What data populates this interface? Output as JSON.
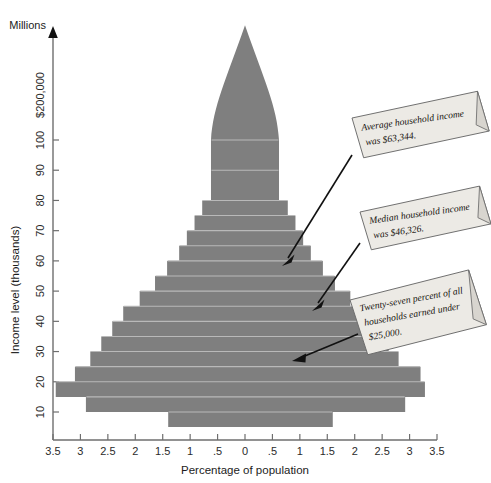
{
  "chart_data": {
    "type": "bar",
    "orientation": "horizontal-pyramid",
    "title": "",
    "xlabel": "Percentage of population",
    "ylabel": "Income level (thousands)",
    "unit_note": "Millions",
    "top_axis_label": "$200,000",
    "xlim": [
      -3.5,
      3.5
    ],
    "xticks": [
      "3.5",
      "3",
      "2.5",
      "2",
      "1.5",
      "1",
      ".5",
      "0",
      ".5",
      "1",
      "1.5",
      "2",
      "2.5",
      "3",
      "3.5"
    ],
    "xtick_values": [
      -3.5,
      -3,
      -2.5,
      -2,
      -1.5,
      -1,
      -0.5,
      0,
      0.5,
      1,
      1.5,
      2,
      2.5,
      3,
      3.5
    ],
    "yticks": [
      "100",
      "90",
      "80",
      "70",
      "60",
      "50",
      "40",
      "30",
      "20",
      "10"
    ],
    "ytick_values": [
      100,
      90,
      80,
      70,
      60,
      50,
      40,
      30,
      20,
      10
    ],
    "grid": false,
    "legend": "none",
    "series": [
      {
        "name": "Percentage of population by income level",
        "bars": [
          {
            "income_label": "under 10",
            "y_low": 5,
            "y_high": 10,
            "half_width": 1.55,
            "left": -1.4,
            "right": 1.6
          },
          {
            "income_label": "10-15",
            "y_low": 10,
            "y_high": 15,
            "half_width": 2.95,
            "left": -2.9,
            "right": 2.92
          },
          {
            "income_label": "15-20",
            "y_low": 15,
            "y_high": 20,
            "half_width": 3.45,
            "left": -3.45,
            "right": 3.28
          },
          {
            "income_label": "20-25",
            "y_low": 20,
            "y_high": 25,
            "half_width": 3.1,
            "left": -3.1,
            "right": 3.2
          },
          {
            "income_label": "25-30",
            "y_low": 25,
            "y_high": 30,
            "half_width": 2.82,
            "left": -2.82,
            "right": 2.8
          },
          {
            "income_label": "30-35",
            "y_low": 30,
            "y_high": 35,
            "half_width": 2.62,
            "left": -2.62,
            "right": 2.62
          },
          {
            "income_label": "35-40",
            "y_low": 35,
            "y_high": 40,
            "half_width": 2.42,
            "left": -2.42,
            "right": 2.42
          },
          {
            "income_label": "40-45",
            "y_low": 40,
            "y_high": 45,
            "half_width": 2.22,
            "left": -2.22,
            "right": 2.22
          },
          {
            "income_label": "45-50",
            "y_low": 45,
            "y_high": 50,
            "half_width": 1.92,
            "left": -1.92,
            "right": 1.92
          },
          {
            "income_label": "50-55",
            "y_low": 50,
            "y_high": 55,
            "half_width": 1.64,
            "left": -1.64,
            "right": 1.64
          },
          {
            "income_label": "55-60",
            "y_low": 55,
            "y_high": 60,
            "half_width": 1.42,
            "left": -1.42,
            "right": 1.42
          },
          {
            "income_label": "60-65",
            "y_low": 60,
            "y_high": 65,
            "half_width": 1.2,
            "left": -1.2,
            "right": 1.2
          },
          {
            "income_label": "65-70",
            "y_low": 65,
            "y_high": 70,
            "half_width": 1.06,
            "left": -1.06,
            "right": 1.06
          },
          {
            "income_label": "70-75",
            "y_low": 70,
            "y_high": 75,
            "half_width": 0.92,
            "left": -0.92,
            "right": 0.92
          },
          {
            "income_label": "75-80",
            "y_low": 75,
            "y_high": 80,
            "half_width": 0.78,
            "left": -0.78,
            "right": 0.78
          },
          {
            "income_label": "80-90",
            "y_low": 80,
            "y_high": 90,
            "half_width": 0.62,
            "left": -0.62,
            "right": 0.62
          },
          {
            "income_label": "90-100",
            "y_low": 90,
            "y_high": 100,
            "half_width": 0.62,
            "left": -0.62,
            "right": 0.62
          },
          {
            "income_label": "100-200 (spire)",
            "y_low": 100,
            "y_high": 200,
            "half_width": 0.22,
            "left": -0.22,
            "right": 0.22
          }
        ]
      }
    ]
  },
  "annotations": [
    {
      "id": "average-income",
      "line1": "Average household income",
      "line2": "was $63,344.",
      "target_income": 60,
      "target_percent": 0.6
    },
    {
      "id": "median-income",
      "line1": "Median household income",
      "line2": "was $46,326.",
      "line3": "",
      "target_income": 45,
      "target_percent": 1.0
    },
    {
      "id": "under-25k",
      "line1": "Twenty-seven percent of all",
      "line2": "households earned under",
      "line3": "$25,000.",
      "target_income": 27,
      "target_percent": 1.1
    }
  ],
  "colors": {
    "bar_fill": "#7f7f7f",
    "row_separator": "#b9b9b9",
    "axis": "#6e6e6e",
    "callout_fill": "#eceae5",
    "callout_border": "#6a6a6a",
    "text": "#1c1c1c",
    "leader": "#111111"
  }
}
